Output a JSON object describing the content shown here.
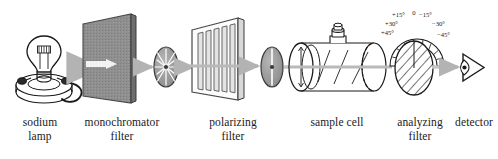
{
  "diagram": {
    "type": "schematic",
    "background_color": "#ffffff",
    "ink_color": "#1a1a1a",
    "beam_color": "#b3b3b3",
    "panel_fill": "#8c8c8c",
    "disc_fill": "#9a9a9a"
  },
  "components": {
    "lamp": {
      "label_line1": "sodium",
      "label_line2": "lamp",
      "icon": "light-bulb-icon"
    },
    "monochromator": {
      "label_line1": "monochromator",
      "label_line2": "filter",
      "icon": "filter-panel-icon"
    },
    "polarizer": {
      "label_line1": "polarizing",
      "label_line2": "filter",
      "icon": "slatted-panel-icon"
    },
    "sample_cell": {
      "label_line1": "sample cell",
      "label_line2": "",
      "icon": "cylinder-cell-icon"
    },
    "analyzer": {
      "label_line1": "analyzing",
      "label_line2": "filter",
      "icon": "hatched-disc-icon"
    },
    "detector": {
      "label_line1": "detector",
      "label_line2": "",
      "icon": "eye-detector-icon"
    }
  },
  "beam_states": {
    "unpolarized_disc": "unpolarized-light-icon",
    "polarized_disc": "plane-polarized-light-icon"
  },
  "protractor": {
    "name": "angle-scale",
    "ticks": [
      {
        "label": "+45°",
        "value": 45
      },
      {
        "label": "+30°",
        "value": 30
      },
      {
        "label": "+15°",
        "value": 15
      },
      {
        "label": "0",
        "value": 0
      },
      {
        "label": "−15°",
        "value": -15
      },
      {
        "label": "−30°",
        "value": -30
      },
      {
        "label": "−45°",
        "value": -45
      }
    ]
  }
}
